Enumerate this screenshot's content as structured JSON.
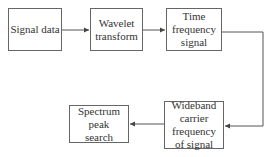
{
  "diagram": {
    "nodes": [
      {
        "id": "signal-data",
        "label": "Signal data"
      },
      {
        "id": "wavelet-transform",
        "label": "Wavelet transform"
      },
      {
        "id": "time-frequency-signal",
        "label": "Time frequency signal"
      },
      {
        "id": "wideband-carrier-frequency",
        "label": "Wideband carrier frequency of signal"
      },
      {
        "id": "spectrum-peak-search",
        "label": "Spectrum peak search"
      }
    ],
    "edges": [
      {
        "from": "signal-data",
        "to": "wavelet-transform"
      },
      {
        "from": "wavelet-transform",
        "to": "time-frequency-signal"
      },
      {
        "from": "time-frequency-signal",
        "to": "wideband-carrier-frequency"
      },
      {
        "from": "wideband-carrier-frequency",
        "to": "spectrum-peak-search"
      }
    ],
    "colors": {
      "line": "#555555",
      "box_border": "#666666",
      "text": "#333333"
    }
  }
}
